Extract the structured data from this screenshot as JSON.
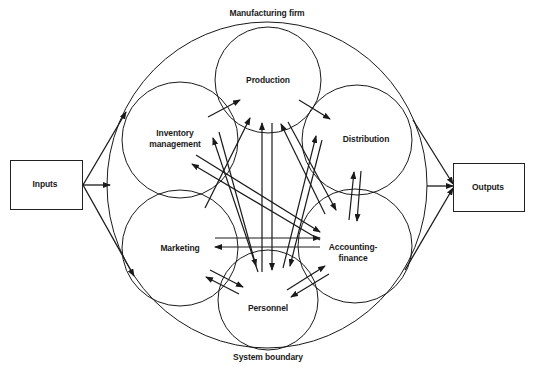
{
  "diagram": {
    "title_top": "Manufacturing firm",
    "title_bottom": "System boundary",
    "inputs_label": "Inputs",
    "outputs_label": "Outputs",
    "subsystems": [
      {
        "id": "production",
        "label": "Production"
      },
      {
        "id": "inventory",
        "label_line1": "Inventory",
        "label_line2": "management"
      },
      {
        "id": "distribution",
        "label": "Distribution"
      },
      {
        "id": "marketing",
        "label": "Marketing"
      },
      {
        "id": "accounting",
        "label_line1": "Accounting-",
        "label_line2": "finance"
      },
      {
        "id": "personnel",
        "label": "Personnel"
      }
    ],
    "colors": {
      "line": "#1a1a1a",
      "background": "#ffffff"
    }
  }
}
